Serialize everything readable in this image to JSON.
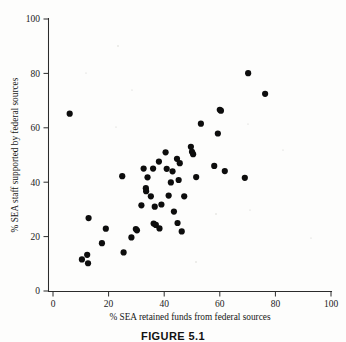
{
  "figure": {
    "caption": "FIGURE 5.1"
  },
  "chart_data": {
    "type": "scatter",
    "title": "",
    "xlabel": "% SEA retained funds from federal sources",
    "ylabel": "% SEA staff supported by federal sources",
    "xlim": [
      0,
      100
    ],
    "ylim": [
      0,
      100
    ],
    "xticks": [
      0,
      20,
      40,
      60,
      80,
      100
    ],
    "yticks": [
      0,
      20,
      40,
      60,
      80,
      100
    ],
    "xtick_labels": [
      "0",
      "20",
      "40",
      "60",
      "80",
      "100"
    ],
    "ytick_labels": [
      "0",
      "20",
      "40",
      "60",
      "80",
      "100"
    ],
    "grid": false,
    "legend": null,
    "marker": "filled-circle",
    "marker_color": "#0d0d0d",
    "series": [
      {
        "name": "SEA agencies",
        "points": [
          [
            6.0,
            65.2
          ],
          [
            10.4,
            11.6
          ],
          [
            12.3,
            13.3
          ],
          [
            12.6,
            10.2
          ],
          [
            12.8,
            26.8
          ],
          [
            17.6,
            17.6
          ],
          [
            19.0,
            22.9
          ],
          [
            24.9,
            42.2
          ],
          [
            25.4,
            14.2
          ],
          [
            28.2,
            19.7
          ],
          [
            29.8,
            22.8
          ],
          [
            30.2,
            22.3
          ],
          [
            31.8,
            31.5
          ],
          [
            32.6,
            45.0
          ],
          [
            33.4,
            37.8
          ],
          [
            33.5,
            36.7
          ],
          [
            34.0,
            41.8
          ],
          [
            35.2,
            34.8
          ],
          [
            36.0,
            45.0
          ],
          [
            36.2,
            24.8
          ],
          [
            36.6,
            31.0
          ],
          [
            37.0,
            24.3
          ],
          [
            38.1,
            47.6
          ],
          [
            38.3,
            23.0
          ],
          [
            39.0,
            31.8
          ],
          [
            40.5,
            51.0
          ],
          [
            40.9,
            44.9
          ],
          [
            41.6,
            35.1
          ],
          [
            42.4,
            39.9
          ],
          [
            43.0,
            44.0
          ],
          [
            43.5,
            29.2
          ],
          [
            44.6,
            48.6
          ],
          [
            44.8,
            25.0
          ],
          [
            45.2,
            40.8
          ],
          [
            45.6,
            47.0
          ],
          [
            46.3,
            21.9
          ],
          [
            47.2,
            34.8
          ],
          [
            49.6,
            53.0
          ],
          [
            50.0,
            51.2
          ],
          [
            50.4,
            50.3
          ],
          [
            51.5,
            41.9
          ],
          [
            53.2,
            61.5
          ],
          [
            58.0,
            46.0
          ],
          [
            59.3,
            57.9
          ],
          [
            60.0,
            66.6
          ],
          [
            60.4,
            66.3
          ],
          [
            61.8,
            44.1
          ],
          [
            69.0,
            41.6
          ],
          [
            70.2,
            80.1
          ],
          [
            76.3,
            72.5
          ]
        ]
      }
    ]
  }
}
